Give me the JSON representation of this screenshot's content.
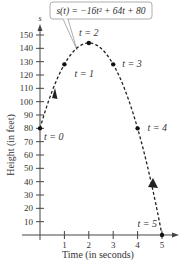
{
  "chart_data": {
    "type": "line",
    "title": "",
    "annotation": "s(t) = −16t² + 64t + 80",
    "xlabel": "Time (in seconds)",
    "ylabel": "Height (in feet)",
    "y_axis_symbol": "s",
    "xlim": [
      0,
      5
    ],
    "ylim": [
      0,
      150
    ],
    "x_ticks": [
      1,
      2,
      3,
      4,
      5
    ],
    "y_ticks": [
      10,
      20,
      30,
      40,
      50,
      60,
      70,
      80,
      90,
      100,
      110,
      120,
      130,
      140,
      150
    ],
    "grid": false,
    "legend": null,
    "series": [
      {
        "name": "s(t) = -16t^2 + 64t + 80",
        "style": "dashed",
        "x": [
          0,
          1,
          2,
          3,
          4,
          5
        ],
        "values": [
          80,
          128,
          144,
          128,
          80,
          0
        ]
      }
    ],
    "marked_points": [
      {
        "label": "t = 0",
        "t": 0,
        "s": 80
      },
      {
        "label": "t = 1",
        "t": 1,
        "s": 128
      },
      {
        "label": "t = 2",
        "t": 2,
        "s": 144
      },
      {
        "label": "t = 3",
        "t": 3,
        "s": 128
      },
      {
        "label": "t = 4",
        "t": 4,
        "s": 80
      },
      {
        "label": "t = 5",
        "t": 5,
        "s": 0
      }
    ],
    "colors": {
      "curve": "#222222",
      "axis": "#444444",
      "text": "#333333",
      "callout_border": "#999999"
    }
  }
}
